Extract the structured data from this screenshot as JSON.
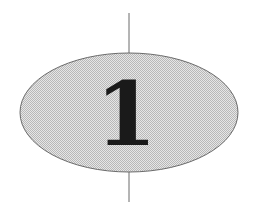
{
  "diagram": {
    "node": {
      "label": "1",
      "shape": "ellipse",
      "fill": "#d4d4d4",
      "stroke": "#6a6a6a",
      "text_color": "#1a1a1a"
    },
    "connector_color": "#6a6a6a"
  }
}
